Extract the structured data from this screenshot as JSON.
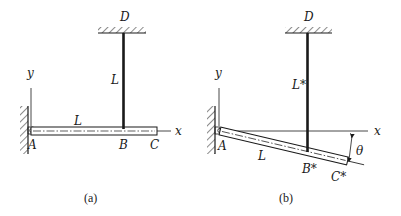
{
  "figure": {
    "panel_a": {
      "caption": "(a)",
      "labels": {
        "D": "D",
        "rod_length": "L",
        "beam_length": "L",
        "y_axis": "y",
        "x_axis": "x",
        "A": "A",
        "B": "B",
        "C": "C"
      }
    },
    "panel_b": {
      "caption": "(b)",
      "labels": {
        "D": "D",
        "rod_length": "L*",
        "beam_length": "L",
        "y_axis": "y",
        "x_axis": "x",
        "A": "A",
        "B": "B*",
        "C": "C*",
        "angle": "θ"
      }
    },
    "colors": {
      "ink": "#1a1a1a",
      "background": "#ffffff"
    }
  }
}
